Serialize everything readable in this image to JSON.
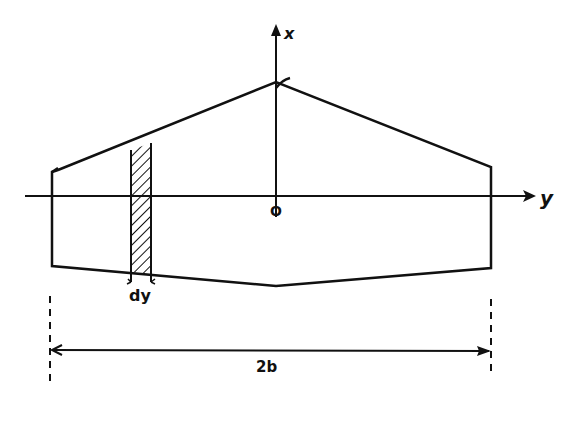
{
  "diagram": {
    "labels": {
      "x_axis": "x",
      "y_axis": "y",
      "origin": "O",
      "strip_width": "dy",
      "span": "2b"
    },
    "colors": {
      "ink": "#111111",
      "background": "#ffffff"
    },
    "geometry": {
      "apex": [
        276,
        82
      ],
      "leading_edge_left_tip": [
        52,
        170
      ],
      "leading_edge_right_tip": [
        491,
        167
      ],
      "trailing_edge_left_tip": [
        52,
        266
      ],
      "trailing_edge_right_tip": [
        491,
        268
      ],
      "trailing_edge_center": [
        276,
        286
      ],
      "y_axis_row": 196,
      "strip_x": [
        131,
        151
      ],
      "span_line_row": 350
    }
  }
}
